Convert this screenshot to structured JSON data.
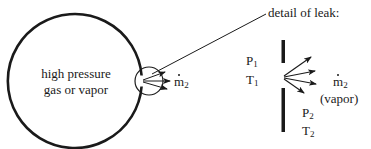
{
  "diagram": {
    "vessel_label_line1": "high pressure",
    "vessel_label_line2": "gas or vapor",
    "leak_flow_symbol": "m",
    "leak_flow_subscript": "2",
    "detail_title": "detail of leak:",
    "upstream_pressure_symbol": "P",
    "upstream_pressure_subscript": "1",
    "upstream_temperature_symbol": "T",
    "upstream_temperature_subscript": "1",
    "outflow_symbol": "m",
    "outflow_subscript": "2",
    "outflow_phase": "(vapor)",
    "downstream_pressure_symbol": "P",
    "downstream_pressure_subscript": "2",
    "downstream_temperature_symbol": "T",
    "downstream_temperature_subscript": "2"
  },
  "colors": {
    "stroke": "#1a1a1a",
    "background": "#ffffff"
  }
}
